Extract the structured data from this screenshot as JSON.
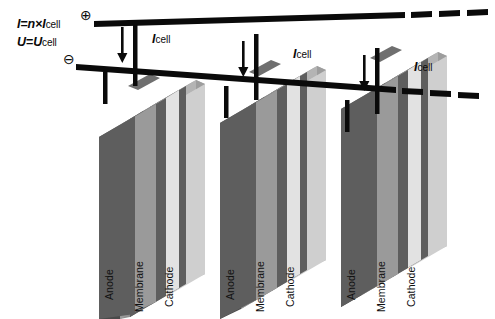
{
  "figure": {
    "background_color": "#ffffff"
  },
  "equations": {
    "current": {
      "lhs": "I",
      "equals": "=",
      "factor": "n",
      "times": "×",
      "rhs_symbol": "I",
      "rhs_subscript": "cell"
    },
    "voltage": {
      "lhs": "U",
      "equals": "=",
      "rhs_symbol": "U",
      "rhs_subscript": "cell"
    }
  },
  "terminals": {
    "positive_glyph": "⊕",
    "negative_glyph": "⊖",
    "positive_name": "positive-terminal",
    "negative_name": "negative-terminal"
  },
  "busbars": {
    "top": {
      "label": "positive-busbar",
      "color": "#0a0a0a",
      "dashed_continuation": true
    },
    "bottom": {
      "label": "negative-busbar",
      "color": "#0a0a0a",
      "dashed_continuation": true
    }
  },
  "current_arrows": [
    {
      "label_symbol": "I",
      "label_subscript": "cell"
    },
    {
      "label_symbol": "I",
      "label_subscript": "cell"
    },
    {
      "label_symbol": "I",
      "label_subscript": "cell"
    }
  ],
  "colors": {
    "electrode_dark": "#5e5e5e",
    "electrode_dark_side": "#4a4a4a",
    "membrane_mid": "#9a9a9a",
    "membrane_light": "#e2e2e2",
    "cell_face_light": "#c9c9c9",
    "cell_face_light_alt": "#d2d2d2",
    "line_black": "#0a0a0a"
  },
  "cell_groups": [
    {
      "name": "cell-group-1",
      "plates": [
        {
          "label": "Anode"
        },
        {
          "label": "Membrane"
        },
        {
          "label": "Cathode"
        }
      ]
    },
    {
      "name": "cell-group-2",
      "plates": [
        {
          "label": "Anode"
        },
        {
          "label": "Membrane"
        },
        {
          "label": "Cathode"
        }
      ]
    },
    {
      "name": "cell-group-3",
      "plates": [
        {
          "label": "Anode"
        },
        {
          "label": "Membrane"
        },
        {
          "label": "Cathode"
        }
      ]
    }
  ],
  "plate_labels": [
    {
      "text": "Anode",
      "x": 103,
      "y": 300
    },
    {
      "text": "Membrane",
      "x": 133,
      "y": 312
    },
    {
      "text": "Cathode",
      "x": 163,
      "y": 307
    },
    {
      "text": "Anode",
      "x": 224,
      "y": 300
    },
    {
      "text": "Membrane",
      "x": 254,
      "y": 312
    },
    {
      "text": "Cathode",
      "x": 284,
      "y": 307
    },
    {
      "text": "Anode",
      "x": 345,
      "y": 300
    },
    {
      "text": "Membrane",
      "x": 375,
      "y": 312
    },
    {
      "text": "Cathode",
      "x": 405,
      "y": 307
    }
  ]
}
